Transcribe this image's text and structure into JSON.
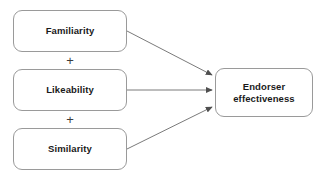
{
  "diagram": {
    "type": "conceptual-model",
    "nodes": {
      "familiarity": {
        "label": "Familiarity"
      },
      "likeability": {
        "label": "Likeability"
      },
      "similarity": {
        "label": "Similarity"
      },
      "endorser": {
        "label": "Endorser\neffectiveness"
      }
    },
    "operators": {
      "plus_1": "+",
      "plus_2": "+"
    },
    "edges": [
      {
        "from": "Familiarity",
        "to": "Endorser effectiveness",
        "style": "arrow"
      },
      {
        "from": "Likeability",
        "to": "Endorser effectiveness",
        "style": "arrow"
      },
      {
        "from": "Similarity",
        "to": "Endorser effectiveness",
        "style": "arrow"
      }
    ],
    "colors": {
      "box_border": "#9a9a9a",
      "box_fill": "#ffffff",
      "arrow": "#6b6b6b",
      "text": "#1a1a1a",
      "background": "#ffffff"
    }
  }
}
